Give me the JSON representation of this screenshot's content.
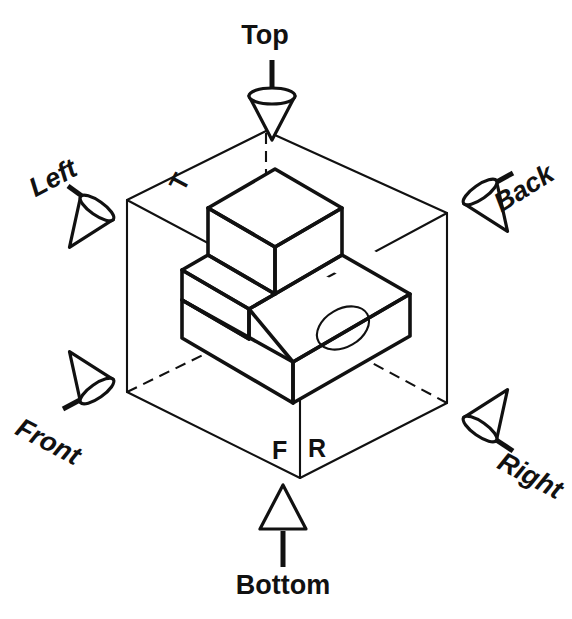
{
  "figure": {
    "kind": "glass-box-orthographic-projection-diagram",
    "background_color": "#ffffff",
    "line_color": "#111111"
  },
  "direction_arrows": [
    {
      "id": "top",
      "label": "Top",
      "points": "down",
      "arrow_style": "cone"
    },
    {
      "id": "bottom",
      "label": "Bottom",
      "points": "up",
      "arrow_style": "cone"
    },
    {
      "id": "left",
      "label": "Left",
      "points": "down-right",
      "arrow_style": "cone"
    },
    {
      "id": "right",
      "label": "Right",
      "points": "up-left",
      "arrow_style": "cone"
    },
    {
      "id": "front",
      "label": "Front",
      "points": "up-right",
      "arrow_style": "cone"
    },
    {
      "id": "back",
      "label": "Back",
      "points": "down-left",
      "arrow_style": "cone"
    }
  ],
  "face_labels": [
    {
      "id": "top-plane",
      "label": "T",
      "meaning": "Top plane"
    },
    {
      "id": "front-plane",
      "label": "F",
      "meaning": "Front plane"
    },
    {
      "id": "right-plane",
      "label": "R",
      "meaning": "Right plane"
    }
  ],
  "object": {
    "description": "Isometric stepped L-block with a round through-hole in the top of the base",
    "features": [
      "vertical-back-wall",
      "left-step-notch",
      "base-slab",
      "circular-hole"
    ]
  }
}
